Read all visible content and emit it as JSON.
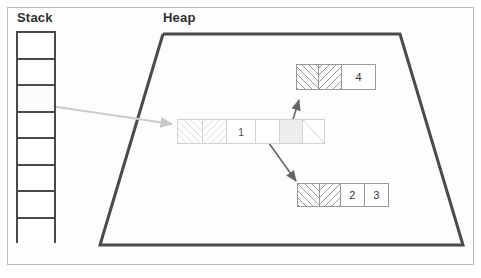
{
  "figure": {
    "title_stack": "Stack",
    "title_heap": "Heap",
    "width": 481,
    "height": 278,
    "colors": {
      "stack_border": "#4a4a4a",
      "heap_border": "#4a4a4a",
      "block_border": "#9a9a9a",
      "faded_block_border": "#d2d2d2",
      "arrow_dark": "#666666",
      "arrow_light": "#cccccc",
      "text": "#333333",
      "background": "#ffffff"
    }
  },
  "stack": {
    "label": "Stack",
    "cell_count": 8,
    "cells": [
      {
        "index": 0,
        "value": "",
        "has_pointer": false
      },
      {
        "index": 1,
        "value": "",
        "has_pointer": false
      },
      {
        "index": 2,
        "value": "",
        "has_pointer": true
      },
      {
        "index": 3,
        "value": "",
        "has_pointer": false
      },
      {
        "index": 4,
        "value": "",
        "has_pointer": false
      },
      {
        "index": 5,
        "value": "",
        "has_pointer": false
      },
      {
        "index": 6,
        "value": "",
        "has_pointer": false
      },
      {
        "index": 7,
        "value": "",
        "has_pointer": false
      }
    ]
  },
  "heap": {
    "label": "Heap",
    "shape": "trapezoid",
    "blocks": [
      {
        "id": "block-top",
        "name": "node-4",
        "faded": false,
        "cells": [
          {
            "fill": "hatch-fwd",
            "value": ""
          },
          {
            "fill": "hatch-back",
            "value": ""
          },
          {
            "fill": "plain",
            "value": "4"
          }
        ]
      },
      {
        "id": "block-middle",
        "name": "node-1",
        "faded": true,
        "cells": [
          {
            "fill": "hatch-fwd",
            "value": ""
          },
          {
            "fill": "hatch-back",
            "value": ""
          },
          {
            "fill": "plain",
            "value": "1"
          },
          {
            "fill": "plain",
            "value": ""
          },
          {
            "fill": "shaded",
            "value": ""
          },
          {
            "fill": "slash",
            "value": ""
          }
        ]
      },
      {
        "id": "block-bottom",
        "name": "node-2-3",
        "faded": false,
        "cells": [
          {
            "fill": "hatch-fwd",
            "value": ""
          },
          {
            "fill": "hatch-back",
            "value": ""
          },
          {
            "fill": "plain",
            "value": "2"
          },
          {
            "fill": "plain",
            "value": "3"
          }
        ]
      }
    ]
  },
  "arrows": [
    {
      "id": "arrow-stack-to-middle",
      "from": "stack-cell-2",
      "to": "block-middle",
      "style": "light"
    },
    {
      "id": "arrow-middle-to-top",
      "from": "block-middle",
      "to": "block-top",
      "style": "dark"
    },
    {
      "id": "arrow-middle-to-bottom",
      "from": "block-middle",
      "to": "block-bottom",
      "style": "dark"
    }
  ]
}
